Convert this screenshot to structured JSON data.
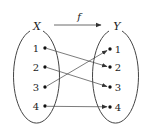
{
  "diagram": {
    "type": "function-mapping",
    "function_label": "f",
    "domain": {
      "label": "X",
      "elements": [
        "1",
        "2",
        "3",
        "4"
      ]
    },
    "codomain": {
      "label": "Y",
      "elements": [
        "1",
        "2",
        "3",
        "4"
      ]
    },
    "mapping": [
      {
        "from": "1",
        "to": "2"
      },
      {
        "from": "2",
        "to": "3"
      },
      {
        "from": "3",
        "to": "1"
      },
      {
        "from": "4",
        "to": "4"
      }
    ],
    "colors": {
      "stroke": "#333333",
      "text": "#222222",
      "background": "#ffffff"
    }
  }
}
